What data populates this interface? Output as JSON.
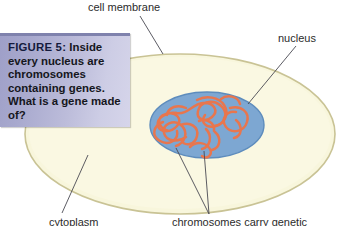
{
  "figure": {
    "type": "cell-biology-diagram"
  },
  "caption": {
    "figure_number": "FIGURE 5:",
    "body": " Inside every nucleus are chromosomes containing genes. What is a gene made of?",
    "full_text": "FIGURE 5: Inside every nucleus are chromosomes containing genes. What is a gene made of?",
    "background_gradient_start": "#9e9fc8",
    "background_gradient_end": "#d6d5ea",
    "top_bar_color": "#7f82ad",
    "text_color": "#15161c"
  },
  "labels": {
    "cell_membrane": "cell membrane",
    "nucleus": "nucleus",
    "cytoplasm": "cytoplasm",
    "chromosomes": "chromosomes carry genetic"
  },
  "colors": {
    "cytoplasm_fill": "#f8f6dc",
    "cell_membrane_stroke": "#c9c395",
    "nucleus_fill": "#7da7d2",
    "nucleus_stroke": "#4d7fb4",
    "chromosome_stroke": "#e8764e",
    "leader_line": "#4a4a52",
    "page_background": "#ffffff"
  },
  "parts": [
    {
      "name": "cell membrane",
      "shape": "ellipse outline"
    },
    {
      "name": "cytoplasm",
      "shape": "pale yellow interior"
    },
    {
      "name": "nucleus",
      "shape": "blue ellipse"
    },
    {
      "name": "chromosomes",
      "shape": "orange tangled threads"
    }
  ]
}
